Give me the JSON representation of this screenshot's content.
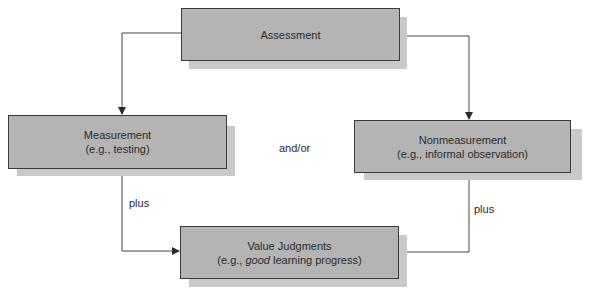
{
  "diagram": {
    "nodes": {
      "assessment": {
        "title": "Assessment"
      },
      "measurement": {
        "title": "Measurement",
        "example": "(e.g., testing)"
      },
      "nonmeasurement": {
        "title": "Nonmeasurement",
        "example": "(e.g., informal observation)"
      },
      "value_judgments": {
        "title": "Value Judgments",
        "example_prefix": "(e.g., ",
        "example_emphasis": "good",
        "example_suffix": " learning progress)"
      }
    },
    "labels": {
      "and_or": "and/or",
      "plus_left": "plus",
      "plus_right": "plus"
    },
    "edges": [
      {
        "from": "assessment",
        "to": "measurement"
      },
      {
        "from": "assessment",
        "to": "nonmeasurement"
      },
      {
        "from": "measurement",
        "to": "value_judgments",
        "label": "plus"
      },
      {
        "from": "nonmeasurement",
        "to": "value_judgments",
        "label": "plus"
      }
    ],
    "colors": {
      "box_fill": "#b4b4b4",
      "shadow": "#c9c9c9",
      "line": "#3a3a3a"
    }
  }
}
